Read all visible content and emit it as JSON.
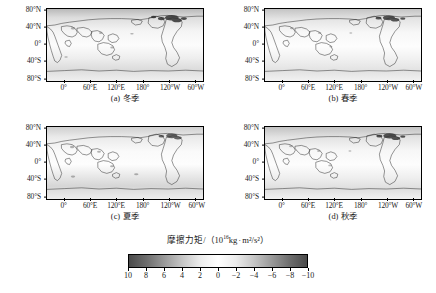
{
  "figure": {
    "panels": [
      {
        "key": "a",
        "index_label": "(a)",
        "caption": "冬季",
        "season_en": "Winter"
      },
      {
        "key": "b",
        "index_label": "(b)",
        "caption": "春季",
        "season_en": "Spring"
      },
      {
        "key": "c",
        "index_label": "(c)",
        "caption": "夏季",
        "season_en": "Summer"
      },
      {
        "key": "d",
        "index_label": "(d)",
        "caption": "秋季",
        "season_en": "Autumn"
      }
    ],
    "colorbar_title_main": "摩擦力矩/（10",
    "colorbar_title_exp": "16",
    "colorbar_title_tail": "kg",
    "colorbar_title_unit": "m²/s²）",
    "colorbar_title_full": "摩擦力矩/（10¹⁶kg · m²/s²）"
  },
  "axes": {
    "y_ticklabels": [
      "80°N",
      "40°N",
      "0°",
      "40°S",
      "80°S"
    ],
    "y_tickvalues": [
      80,
      40,
      0,
      -40,
      -80
    ],
    "x_ticklabels": [
      "0°",
      "60°E",
      "120°E",
      "180°",
      "120°W",
      "60°W"
    ],
    "x_tickvalues": [
      0,
      60,
      120,
      180,
      240,
      300
    ]
  },
  "chart_data": {
    "type": "heatmap",
    "title": "",
    "subtitle": "",
    "xlabel": "",
    "ylabel": "",
    "panel_count": 4,
    "panel_layout": "2x2",
    "projection": "equirectangular",
    "central_longitude": 20,
    "xlim": [
      -20,
      340
    ],
    "ylim": [
      -90,
      90
    ],
    "grid": false,
    "legend_position": "bottom-center",
    "panels": [
      {
        "label": "(a) 冬季",
        "categories": [
          "80°N",
          "40°N",
          "0°",
          "40°S",
          "80°S"
        ],
        "values": [
          6.5,
          2.0,
          -0.5,
          -2.5,
          0.5
        ],
        "note": "冬季 friction torque field; strongest positive values over N. Atlantic / N. Pacific high latitudes"
      },
      {
        "label": "(b) 春季",
        "categories": [
          "80°N",
          "40°N",
          "0°",
          "40°S",
          "80°S"
        ],
        "values": [
          5.0,
          1.5,
          -0.5,
          -2.0,
          0.5
        ],
        "note": "春季 field; moderated mid-latitude amplitudes relative to winter"
      },
      {
        "label": "(c) 夏季",
        "categories": [
          "80°N",
          "40°N",
          "0°",
          "40°S",
          "80°S"
        ],
        "values": [
          3.5,
          1.0,
          -1.0,
          -3.5,
          1.0
        ],
        "note": "夏季 field; Southern Hemisphere mid-latitude negative band strengthens"
      },
      {
        "label": "(d) 秋季",
        "categories": [
          "80°N",
          "40°N",
          "0°",
          "40°S",
          "80°S"
        ],
        "values": [
          5.5,
          1.5,
          -0.5,
          -2.5,
          0.5
        ],
        "note": "秋季 field; returns toward winter-like pattern"
      }
    ],
    "colorbar": {
      "label": "摩擦力矩/（10¹⁶kg · m²/s²）",
      "unit": "10^16 kg·m²/s²",
      "ticks": [
        "10",
        "8",
        "6",
        "4",
        "2",
        "0",
        "-2",
        "-4",
        "-6",
        "-8",
        "-10"
      ],
      "tickvalues": [
        10,
        8,
        6,
        4,
        2,
        0,
        -2,
        -4,
        -6,
        -8,
        -10
      ],
      "vmin": 10,
      "vmax": -10,
      "orientation": "horizontal",
      "direction": "reversed",
      "colormap": "grayscale-diverging",
      "colors": [
        "#4a4a4a",
        "#6e6e6e",
        "#9a9a9a",
        "#c6c6c6",
        "#ececec",
        "#ffffff",
        "#ececec",
        "#c6c6c6",
        "#9a9a9a",
        "#6e6e6e",
        "#4a4a4a"
      ]
    }
  },
  "style": {
    "map_background": "#f2f2f2",
    "coastline_color": "#1a1a1a",
    "frame_color": "#000000",
    "page_background": "#ffffff"
  }
}
